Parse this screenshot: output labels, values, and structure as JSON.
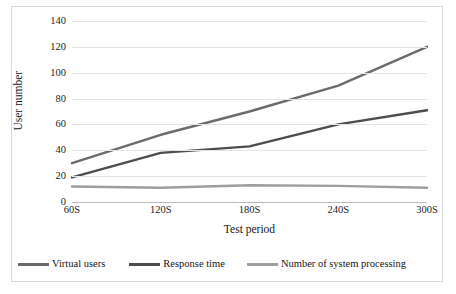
{
  "chart_data": {
    "type": "line",
    "title": "",
    "xlabel": "Test period",
    "ylabel": "User number",
    "categories": [
      "60S",
      "120S",
      "180S",
      "240S",
      "300S"
    ],
    "yticks": [
      0,
      20,
      40,
      60,
      80,
      100,
      120,
      140
    ],
    "ylim": [
      0,
      140
    ],
    "grid": true,
    "legend_position": "bottom",
    "series": [
      {
        "name": "Virtual users",
        "color": "#6b6b6b",
        "values": [
          30,
          52,
          70,
          90,
          120
        ]
      },
      {
        "name": "Response time",
        "color": "#4d4d4d",
        "values": [
          19,
          38,
          43,
          60,
          71
        ]
      },
      {
        "name": "Number of system processing",
        "color": "#9e9e9e",
        "values": [
          12,
          11,
          13,
          12.5,
          11
        ]
      }
    ]
  },
  "style": {
    "grid_color": "#e4e4e4",
    "axis_color": "#b9b9b9",
    "frame_color": "#d8d8d8",
    "text_color": "#1d1d1d",
    "background": "#ffffff"
  }
}
